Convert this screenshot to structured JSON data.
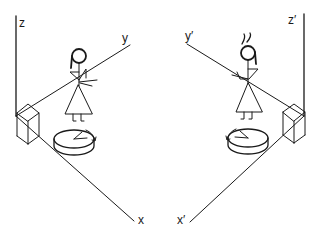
{
  "diagram": {
    "left_system": {
      "axes": {
        "z_label": "z",
        "y_label": "y",
        "x_label": "x"
      },
      "objects": [
        "stick-figure",
        "box",
        "rotating-disc"
      ]
    },
    "right_system": {
      "axes": {
        "z_label": "z′",
        "y_label": "y′",
        "x_label": "x′"
      },
      "objects": [
        "stick-figure",
        "box",
        "rotating-disc"
      ]
    },
    "colors": {
      "ink": "#1a1a1a",
      "background": "#ffffff"
    }
  }
}
